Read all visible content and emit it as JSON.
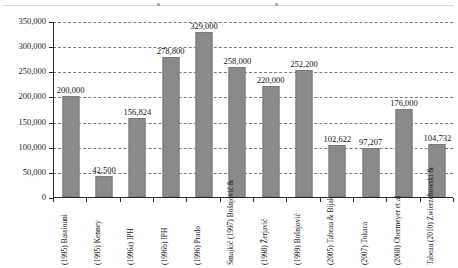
{
  "chart_data": {
    "type": "bar",
    "title": "",
    "subtitle": "",
    "xlabel": "",
    "ylabel": "",
    "ylim": [
      0,
      350000
    ],
    "ytick_values": [
      0,
      50000,
      100000,
      150000,
      200000,
      250000,
      300000,
      350000
    ],
    "ytick_labels": [
      "0",
      "50,000",
      "100,000",
      "150,000",
      "200,000",
      "250,000",
      "300,000",
      "350,000"
    ],
    "grid": true,
    "grid_style": "dashed horizontal",
    "legend": "none",
    "bar_color": "#8a8a8a",
    "axis_color": "#2b2b2b",
    "categories": [
      "Bassiouni (1995)",
      "Kenney (1995)",
      "IPH (1996a)",
      "IPH (1996b)",
      "Prado (1996)",
      "Bošnjović & Smajkić (1997)",
      "Žerjavić (1998)",
      "Bošnjović (1999)",
      "Tabeau & Bijak (2005)",
      "Tokaca (2007)",
      "Obermeyer et al (2008)",
      "Zwierzchowski & Tabeau (2010)"
    ],
    "category_lines": [
      [
        "Bassiouni",
        "(1995)"
      ],
      [
        "Kenney",
        "(1995)"
      ],
      [
        "IPH",
        "(1996a)"
      ],
      [
        "IPH",
        "(1996b)"
      ],
      [
        "Prado",
        "(1996)"
      ],
      [
        "Bošnjović &",
        "Smajkić (1997)"
      ],
      [
        "Žerjavić",
        "(1998)"
      ],
      [
        "Bošnjović",
        "(1999)"
      ],
      [
        "Tabeau & Bijak",
        "(2005)"
      ],
      [
        "Tokaca",
        "(2007)"
      ],
      [
        "Obermeyer et al",
        "(2008)"
      ],
      [
        "Zwierzchowski &",
        "Tabeau (2010)"
      ]
    ],
    "values": [
      200000,
      42500,
      156824,
      278800,
      329000,
      258000,
      220000,
      252200,
      102622,
      97207,
      176000,
      104732
    ],
    "value_labels": [
      "200,000",
      "42,500",
      "156,824",
      "278,800",
      "329,000",
      "258,000",
      "220,000",
      "252,200",
      "102,622",
      "97,207",
      "176,000",
      "104,732"
    ]
  }
}
